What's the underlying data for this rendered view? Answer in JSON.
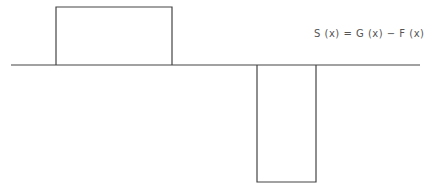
{
  "diagram": {
    "equation": "S (x) = G (x) − F (x)",
    "stroke_color": "#444444",
    "background": "#ffffff",
    "baseline": {
      "x1": 11,
      "x2": 420,
      "y": 65
    },
    "positive_pulse": {
      "x_left": 56,
      "x_right": 172,
      "y_top": 7,
      "y_base": 65
    },
    "negative_pulse": {
      "x_left": 257,
      "x_right": 316,
      "y_bottom": 182,
      "y_base": 65
    }
  }
}
